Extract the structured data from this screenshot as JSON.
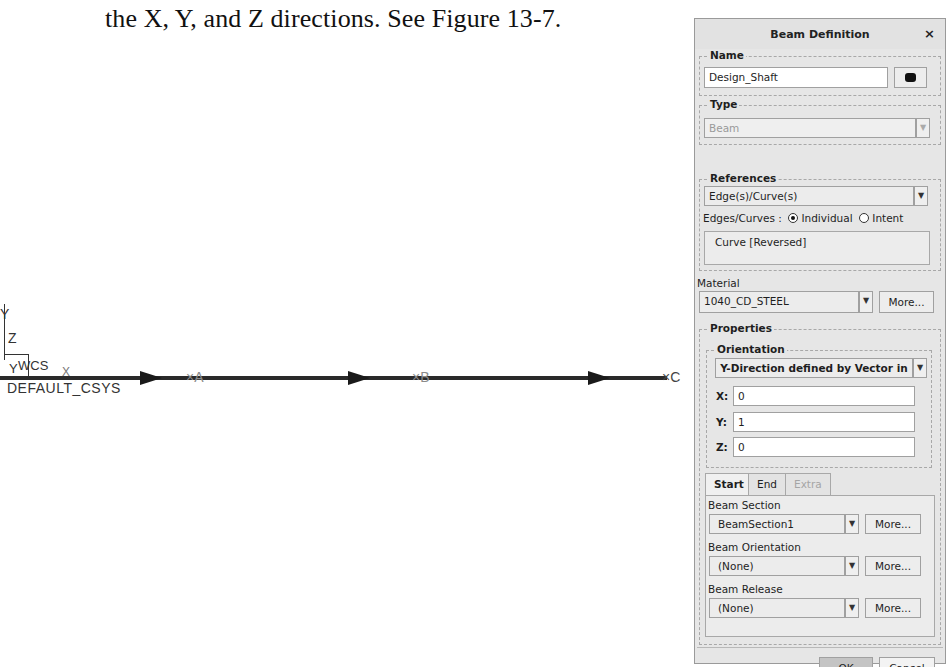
{
  "caption": "the X, Y, and Z directions. See Figure 13-7.",
  "graphics": {
    "coordinate_system": {
      "axis_labels": {
        "y": "Y",
        "z": "Z"
      },
      "wcs_label": "WCS",
      "wcs_y": "Y",
      "x_label": "X",
      "default_csys_label": "DEFAULT_CSYS"
    },
    "points": [
      {
        "label": "×A"
      },
      {
        "label": "×B"
      },
      {
        "label": "×C"
      }
    ]
  },
  "dialog": {
    "title": "Beam Definition",
    "close_icon": "×",
    "name_group": {
      "label": "Name",
      "value": "Design_Shaft",
      "color_button_icon": "color-swatch-icon"
    },
    "type_group": {
      "label": "Type",
      "value": "Beam"
    },
    "references_group": {
      "label": "References",
      "selector": "Edge(s)/Curve(s)",
      "edges_label": "Edges/Curves :",
      "radio_options": [
        {
          "label": "Individual",
          "selected": true
        },
        {
          "label": "Intent",
          "selected": false
        }
      ],
      "collector_items": [
        "Curve [Reversed]"
      ]
    },
    "material": {
      "label": "Material",
      "value": "1040_CD_STEEL",
      "more_label": "More..."
    },
    "properties": {
      "label": "Properties",
      "orientation": {
        "label": "Orientation",
        "value": "Y-Direction defined by Vector in",
        "x_label": "X:",
        "x_value": "0",
        "y_label": "Y:",
        "y_value": "1",
        "z_label": "Z:",
        "z_value": "0"
      },
      "tabs": [
        {
          "label": "Start",
          "active": true
        },
        {
          "label": "End",
          "active": false
        },
        {
          "label": "Extra",
          "active": false,
          "disabled": true
        }
      ],
      "beam_section": {
        "label": "Beam Section",
        "value": "BeamSection1",
        "more_label": "More..."
      },
      "beam_orientation": {
        "label": "Beam Orientation",
        "value": "(None)",
        "more_label": "More..."
      },
      "beam_release": {
        "label": "Beam Release",
        "value": "(None)",
        "more_label": "More..."
      }
    },
    "ok_label": "OK",
    "cancel_label": "Cancel"
  }
}
